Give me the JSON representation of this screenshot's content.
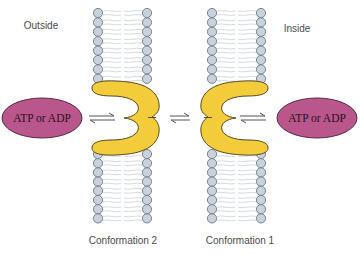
{
  "labels": {
    "outside": "Outside",
    "inside": "Inside",
    "conformation_left": "Conformation 2",
    "conformation_right": "Conformation 1"
  },
  "ligands": {
    "left": "ATP or ADP",
    "right": "ATP or ADP"
  },
  "colors": {
    "protein_fill": "#f2cc3a",
    "protein_stroke": "#5a4a1c",
    "ligand_fill": "#b9578c",
    "ligand_stroke": "#5a2a45",
    "lipid_head_fill": "#c9d2dc",
    "lipid_head_stroke": "#6c7884",
    "lipid_tail": "#d3dbe2",
    "label_text": "#4a4a4a",
    "arrow": "#555555"
  },
  "diagram": {
    "type": "membrane transport conformational equilibrium",
    "membranes": [
      {
        "id": "left",
        "head_columns_x": [
          98,
          147
        ]
      },
      {
        "id": "right",
        "head_columns_x": [
          212,
          261
        ]
      }
    ],
    "equilibria": [
      {
        "between": [
          "ligand-left",
          "protein-conformation-2"
        ]
      },
      {
        "between": [
          "protein-conformation-2",
          "protein-conformation-1"
        ]
      },
      {
        "between": [
          "protein-conformation-1",
          "ligand-right"
        ]
      }
    ]
  }
}
